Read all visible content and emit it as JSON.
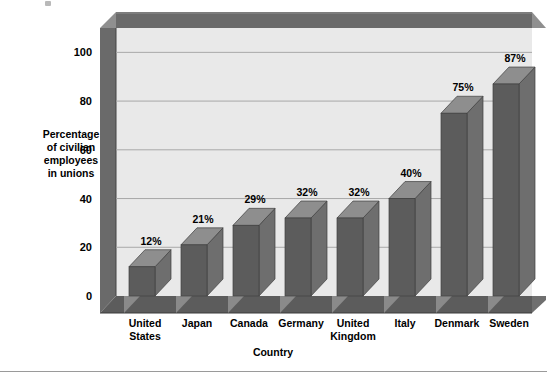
{
  "chart_data": {
    "type": "bar",
    "title": "",
    "subtitle": "",
    "xlabel": "Country",
    "ylabel": "Percentage of civilian employees in unions",
    "ylabel_lines": [
      "Percentage",
      "of civilian",
      "employees",
      "in unions"
    ],
    "categories": [
      "United States",
      "Japan",
      "Canada",
      "Germany",
      "United Kingdom",
      "Italy",
      "Denmark",
      "Sweden"
    ],
    "category_lines": [
      [
        "United",
        "States"
      ],
      [
        "Japan"
      ],
      [
        "Canada"
      ],
      [
        "Germany"
      ],
      [
        "United",
        "Kingdom"
      ],
      [
        "Italy"
      ],
      [
        "Denmark"
      ],
      [
        "Sweden"
      ]
    ],
    "values": [
      12,
      21,
      29,
      32,
      32,
      40,
      75,
      87
    ],
    "data_labels": [
      "12%",
      "21%",
      "29%",
      "32%",
      "32%",
      "40%",
      "75%",
      "87%"
    ],
    "ylim": [
      0,
      110
    ],
    "yticks": [
      0,
      20,
      40,
      60,
      80,
      100
    ],
    "ytick_labels": [
      "0",
      "20",
      "40",
      "60",
      "80",
      "100"
    ],
    "grid": true,
    "legend": "none",
    "style": "3d-column",
    "colors": {
      "bar_front": "#5c5c5c",
      "bar_top": "#8e8e8e",
      "bar_side": "#6e6e6e",
      "plot_background": "#e9e9e9",
      "wall": "#6a6a6a",
      "wall_bevel": "#8a8a8a",
      "floor": "#5c5c5c",
      "floor_bevel": "#8a8a8a",
      "gridline": "#a8a8a8",
      "text": "#000000",
      "page_background": "#ffffff",
      "footer_rule": "#9a9a9a"
    }
  }
}
